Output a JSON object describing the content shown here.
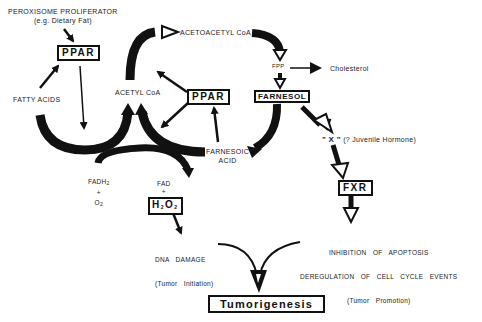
{
  "diagram": {
    "nodes": {
      "peroxisome_proliferator": "PEROXISOME PROLIFERATOR",
      "peroxisome_example": "(e.g. Dietary Fat)",
      "ppar_left": "PPAR",
      "fatty_acids": "FATTY ACIDS",
      "acetyl_coa": "ACETYL CoA",
      "acetoacetyl_coa": "ACETOACETYL CoA",
      "fpp": "FPP",
      "cholesterol": "Cholesterol",
      "farnesol": "FARNESOL",
      "ppar_center": "PPAR",
      "farnesoic_acid_line1": "FARNESOIC",
      "farnesoic_acid_line2": "ACID",
      "x_label": "\" X \"",
      "juvenile_hormone": "(? Juvenile Hormone)",
      "fxr": "FXR",
      "fadh2_base": "FADH",
      "fadh2_sub": "2",
      "plus1": "+",
      "o2_base": "O",
      "o2_sub": "2",
      "fad": "FAD",
      "plus2": "+",
      "h2o2_h": "H",
      "h2o2_sub1": "2",
      "h2o2_o": "O",
      "h2o2_sub2": "2",
      "dna_damage": "DNA   DAMAGE",
      "tumor_initiation": "(Tumor   Initiation)",
      "inhibition_apoptosis": "INHIBITION   OF   APOPTOSIS",
      "deregulation": "DEREGULATION   OF   CELL   CYCLE   EVENTS",
      "tumor_promotion": "(Tumor   Promotion)",
      "tumorigenesis": "Tumorigenesis"
    },
    "edges": [
      {
        "from": "peroxisome_proliferator",
        "to": "ppar_left"
      },
      {
        "from": "fatty_acids",
        "to": "ppar_left"
      },
      {
        "from": "ppar_left",
        "to": "fatty_acids_cycle"
      },
      {
        "from": "fatty_acids",
        "to": "acetyl_coa",
        "style": "thick-curve"
      },
      {
        "from": "acetyl_coa",
        "to": "acetoacetyl_coa",
        "style": "thick-curve-open-head"
      },
      {
        "from": "acetoacetyl_coa",
        "to": "fpp",
        "style": "thick-curve-open-head"
      },
      {
        "from": "fpp",
        "to": "cholesterol"
      },
      {
        "from": "fpp",
        "to": "farnesol",
        "style": "open-head"
      },
      {
        "from": "farnesol",
        "to": "farnesoic_acid",
        "style": "thick-curve"
      },
      {
        "from": "farnesoic_acid",
        "to": "acetyl_coa",
        "style": "thick-curve"
      },
      {
        "from": "farnesoic_acid",
        "to": "ppar_center"
      },
      {
        "from": "ppar_center",
        "to": "acetyl_coa"
      },
      {
        "from": "ppar_center",
        "to": "farnesoic_cycle"
      },
      {
        "from": "fadh2_o2",
        "to": "fad_h2o2",
        "style": "thick-curve"
      },
      {
        "from": "farnesol",
        "to": "x",
        "style": "open-head"
      },
      {
        "from": "x",
        "to": "fxr",
        "style": "open-head"
      },
      {
        "from": "fxr",
        "to": "inhibition_apoptosis",
        "style": "open-head"
      },
      {
        "from": "h2o2",
        "to": "dna_damage"
      },
      {
        "from": "dna_damage",
        "to": "tumorigenesis"
      },
      {
        "from": "deregulation",
        "to": "tumorigenesis"
      }
    ],
    "colors": {
      "ink": "#111111",
      "background": "#ffffff"
    }
  }
}
